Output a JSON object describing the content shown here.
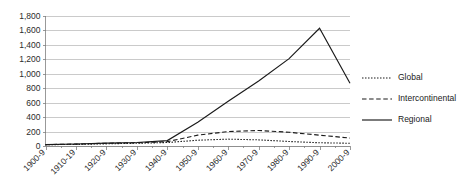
{
  "chart_data": {
    "type": "line",
    "title": "",
    "xlabel": "",
    "ylabel": "",
    "categories": [
      "1900-9",
      "1910-19",
      "1920-9",
      "1930-9",
      "1940-9",
      "1950-9",
      "1960-9",
      "1970-9",
      "1980-9",
      "1990-9",
      "2000-9"
    ],
    "ylim": [
      0,
      1800
    ],
    "yticks": [
      0,
      200,
      400,
      600,
      800,
      1000,
      1200,
      1400,
      1600,
      1800
    ],
    "ytick_labels": [
      "0",
      "200",
      "400",
      "600",
      "800",
      "1,000",
      "1,200",
      "1,400",
      "1,600",
      "1,800"
    ],
    "grid": true,
    "legend_position": "right",
    "series": [
      {
        "name": "Global",
        "style": "dotted",
        "color": "#1a1a1a",
        "values": [
          18,
          22,
          30,
          38,
          48,
          80,
          95,
          85,
          62,
          45,
          38
        ]
      },
      {
        "name": "Intercontinental",
        "style": "dashed",
        "color": "#1a1a1a",
        "values": [
          20,
          26,
          38,
          45,
          60,
          150,
          200,
          215,
          190,
          150,
          110
        ]
      },
      {
        "name": "Regional",
        "style": "solid",
        "color": "#1a1a1a",
        "values": [
          20,
          28,
          40,
          48,
          75,
          330,
          620,
          900,
          1210,
          1630,
          870
        ]
      }
    ]
  },
  "legend": {
    "items": [
      {
        "label": "Global"
      },
      {
        "label": "Intercontinental"
      },
      {
        "label": "Regional"
      }
    ]
  }
}
